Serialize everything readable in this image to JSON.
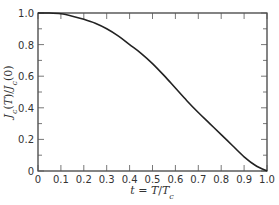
{
  "chart_data": {
    "type": "line",
    "title": "",
    "xlabel": "t = T/T_c",
    "ylabel": "J_c(T)/J_c(0)",
    "xlim": [
      0,
      1.0
    ],
    "ylim": [
      0,
      1.0
    ],
    "xticks": [
      "0",
      "0.1",
      "0.2",
      "0.3",
      "0.4",
      "0.5",
      "0.6",
      "0.7",
      "0.8",
      "0.9",
      "1.0"
    ],
    "yticks": [
      "0",
      "0.2",
      "0.4",
      "0.6",
      "0.8",
      "1.0"
    ],
    "grid": false,
    "legend": null,
    "series": [
      {
        "name": "J_c(T)/J_c(0)",
        "x": [
          0,
          0.05,
          0.1,
          0.15,
          0.2,
          0.25,
          0.3,
          0.35,
          0.4,
          0.45,
          0.5,
          0.55,
          0.6,
          0.65,
          0.7,
          0.75,
          0.8,
          0.85,
          0.9,
          0.95,
          1.0
        ],
        "values": [
          1.0,
          1.0,
          0.995,
          0.98,
          0.96,
          0.935,
          0.9,
          0.855,
          0.8,
          0.745,
          0.68,
          0.605,
          0.525,
          0.445,
          0.37,
          0.3,
          0.23,
          0.16,
          0.09,
          0.035,
          0.0
        ]
      }
    ]
  }
}
